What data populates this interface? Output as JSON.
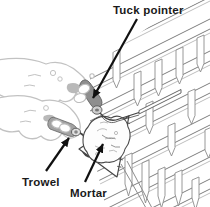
{
  "figure": {
    "labels": {
      "tuck_pointer": "Tuck pointer",
      "trowel": "Trowel",
      "mortar": "Mortar"
    },
    "colors": {
      "background": "#ffffff",
      "label_text": "#1a1a1a",
      "arrow": "#111111",
      "wall_line": "#8c8c8c",
      "wall_line_dark": "#7e7e7e",
      "wall_line_light": "#adadad",
      "hand_outline": "#c2c2c2",
      "hand_shadow": "#adadad",
      "tool_dark": "#8e8e8e",
      "tool_metal": "#cfcfcf",
      "outline_dark": "#444444",
      "mortar_texture": "#b5b5b5"
    }
  }
}
